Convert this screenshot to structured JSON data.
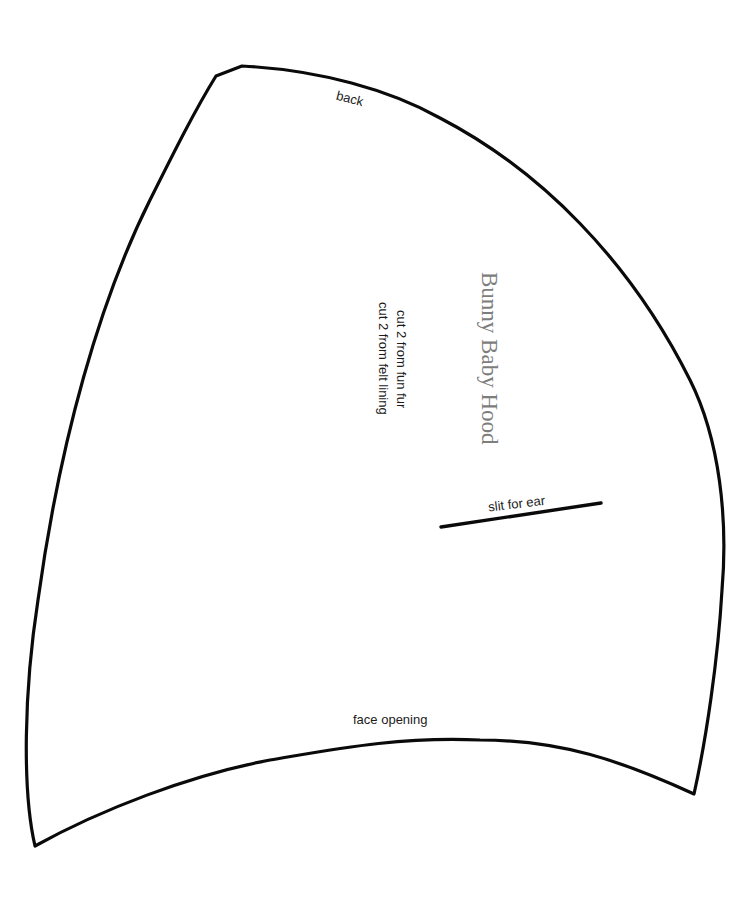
{
  "pattern": {
    "title": "Bunny Baby Hood",
    "instructions": [
      "cut 2 from fun fur",
      "cut 2 from felt lining"
    ],
    "edge_labels": {
      "top": "back",
      "bottom": "face opening"
    },
    "markings": {
      "slit_label": "slit for ear"
    },
    "colors": {
      "outline": "#0a0a0a",
      "title_text": "#7d7d7d",
      "label_text": "#1c1c1c",
      "background": "#ffffff"
    }
  }
}
